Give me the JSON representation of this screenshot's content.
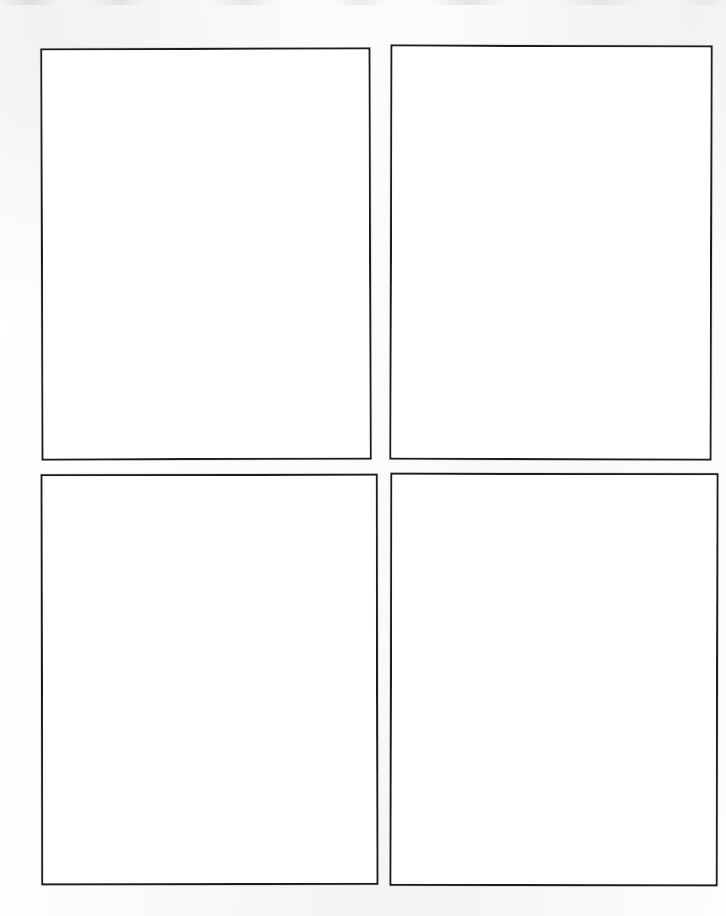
{
  "document": {
    "type": "blank-four-panel-template",
    "title": "",
    "background_color": "#fbfbfa",
    "page_width": 726,
    "page_height": 916,
    "ink_color": "#1c1c1c",
    "panel_fill_color": "#ffffff",
    "panel_count": 4,
    "grid": {
      "rows": 2,
      "columns": 2
    },
    "content_text": ""
  },
  "panels": [
    {
      "id": "panel-1",
      "label": "",
      "position": "top-left",
      "row": 1,
      "column": 1,
      "x": 41,
      "y": 48,
      "width": 330,
      "height": 412,
      "border_width": "2.5px",
      "border_color": "#1c1c1c",
      "fill": "#ffffff",
      "content": ""
    },
    {
      "id": "panel-2",
      "label": "",
      "position": "top-right",
      "row": 1,
      "column": 2,
      "x": 390,
      "y": 45,
      "width": 322,
      "height": 415,
      "border_width": "2.5px",
      "border_color": "#1c1c1c",
      "fill": "#ffffff",
      "content": ""
    },
    {
      "id": "panel-3",
      "label": "",
      "position": "bottom-left",
      "row": 2,
      "column": 1,
      "x": 41,
      "y": 474,
      "width": 337,
      "height": 411,
      "border_width": "2.5px",
      "border_color": "#1c1c1c",
      "fill": "#ffffff",
      "content": ""
    },
    {
      "id": "panel-4",
      "label": "",
      "position": "bottom-right",
      "row": 2,
      "column": 2,
      "x": 390,
      "y": 473,
      "width": 328,
      "height": 413,
      "border_width": "2.5px",
      "border_color": "#1c1c1c",
      "fill": "#ffffff",
      "content": ""
    }
  ]
}
